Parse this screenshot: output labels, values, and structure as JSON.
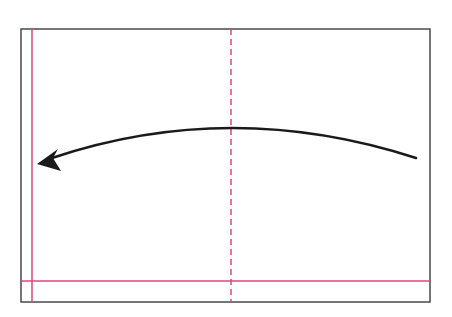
{
  "diagram": {
    "colors": {
      "frame": "#4a4a4a",
      "guide_line": "#e0457b",
      "arrow": "#1a1a1a",
      "background": "#ffffff"
    },
    "frame": {
      "x": 21,
      "y": 29,
      "width": 409,
      "height": 273
    },
    "guides": {
      "vertical_solid_x": 32,
      "horizontal_solid_y": 281,
      "vertical_dashed_x": 231
    },
    "arrow": {
      "start": [
        416,
        158
      ],
      "control": [
        231,
        98
      ],
      "end": [
        38,
        163
      ],
      "direction": "left",
      "icon": "curved-arrow-left-icon"
    }
  }
}
